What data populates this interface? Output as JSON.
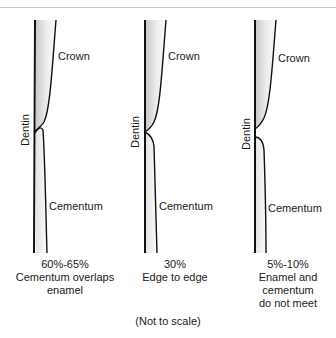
{
  "figure": {
    "note": "(Not to scale)",
    "colors": {
      "line": "#111111",
      "fill_dark": "#d0d0d0",
      "fill_light": "#f7f7f7",
      "rule": "#c8c8c8"
    },
    "panels": [
      {
        "crown_label": "Crown",
        "dentin_label": "Dentin",
        "cementum_label": "Cementum",
        "percent": "60%-65%",
        "desc_line1": "Cementum overlaps",
        "desc_line2": "enamel",
        "junction": "overlap"
      },
      {
        "crown_label": "Crown",
        "dentin_label": "Dentin",
        "cementum_label": "Cementum",
        "percent": "30%",
        "desc_line1": "Edge to edge",
        "desc_line2": "",
        "junction": "edge-to-edge"
      },
      {
        "crown_label": "Crown",
        "dentin_label": "Dentin",
        "cementum_label": "Cementum",
        "percent": "5%-10%",
        "desc_line1": "Enamel and",
        "desc_line2": "cementum",
        "desc_line3": "do not meet",
        "junction": "gap"
      }
    ]
  }
}
